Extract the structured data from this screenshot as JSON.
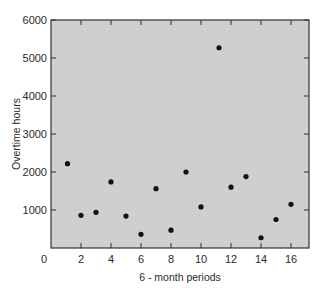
{
  "chart_data": {
    "type": "scatter",
    "title": "",
    "xlabel": "6 - month periods",
    "ylabel": "Overtime hours",
    "xlim": [
      0,
      17.2
    ],
    "ylim": [
      0,
      6000
    ],
    "x_ticks": [
      0,
      2,
      4,
      6,
      8,
      10,
      12,
      14,
      16
    ],
    "y_ticks": [
      1000,
      2000,
      3000,
      4000,
      5000,
      6000
    ],
    "grid": false,
    "legend": null,
    "background": "#cfcfcf",
    "marker_color": "#111111",
    "series": [
      {
        "name": "Overtime hours",
        "x": [
          1.1,
          2,
          3,
          4,
          5,
          6,
          7,
          8,
          9,
          10,
          11.2,
          12,
          13,
          14,
          15,
          16
        ],
        "y": [
          2220,
          860,
          940,
          1740,
          840,
          360,
          1560,
          470,
          2000,
          1080,
          5270,
          1600,
          1880,
          270,
          750,
          1150
        ]
      }
    ]
  }
}
